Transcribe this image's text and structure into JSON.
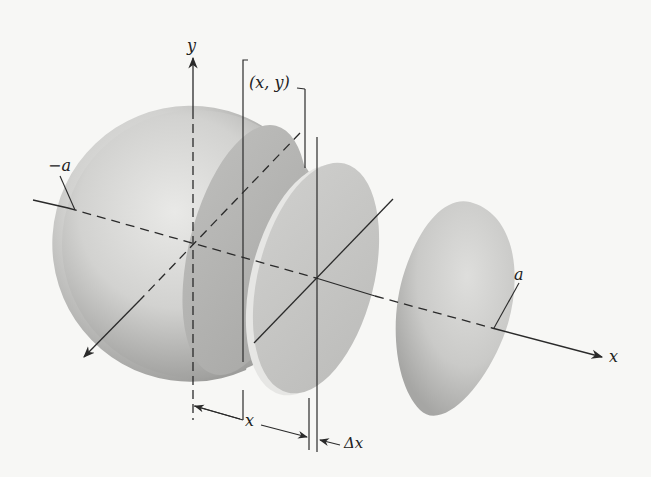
{
  "figure": {
    "labels": {
      "y_axis": "y",
      "x_axis": "x",
      "neg_a": "−a",
      "pos_a": "a",
      "point": "(x, y)",
      "dim_x": "x",
      "dim_dx": "Δx"
    },
    "colors": {
      "background": "#f7f7f5",
      "line": "#2a2a2a",
      "solid_light": "#e2e2e0",
      "solid_dark": "#9a9a98",
      "face": "#bdbdbb"
    }
  }
}
